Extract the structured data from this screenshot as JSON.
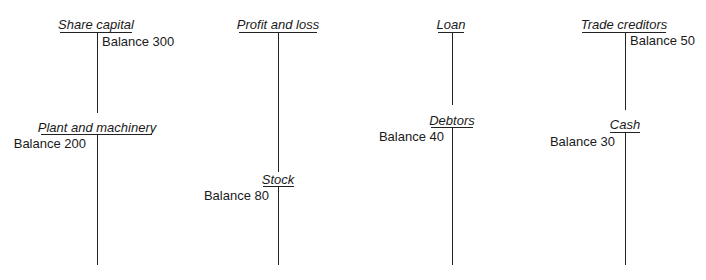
{
  "diagram": {
    "type": "t-accounts",
    "accounts": [
      {
        "id": "share-capital",
        "title": "Share capital",
        "balance": "Balance 300",
        "side": "credit"
      },
      {
        "id": "plant-machinery",
        "title": "Plant and machinery",
        "balance": "Balance 200",
        "side": "debit"
      },
      {
        "id": "profit-loss",
        "title": "Profit and loss",
        "balance": "",
        "side": ""
      },
      {
        "id": "stock",
        "title": "Stock",
        "balance": "Balance 80",
        "side": "debit"
      },
      {
        "id": "loan",
        "title": "Loan",
        "balance": "",
        "side": ""
      },
      {
        "id": "debtors",
        "title": "Debtors",
        "balance": "Balance 40",
        "side": "debit"
      },
      {
        "id": "trade-creditors",
        "title": "Trade creditors",
        "balance": "Balance 50",
        "side": "credit"
      },
      {
        "id": "cash",
        "title": "Cash",
        "balance": "Balance 30",
        "side": "debit"
      }
    ]
  }
}
